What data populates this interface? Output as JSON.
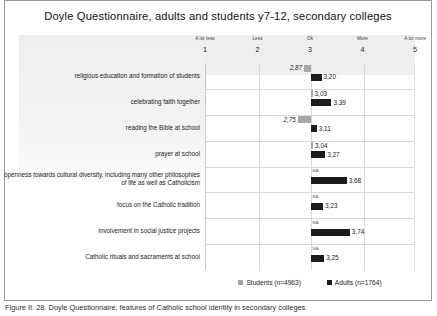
{
  "figure": {
    "caption": "Figure II. 28. Doyle Questionnaire, features of Catholic school identity in secondary colleges"
  },
  "chart_data": {
    "type": "bar",
    "orientation": "horizontal",
    "title": "Doyle Questionnaire, adults and students y7-12, secondary colleges",
    "xlabel": "",
    "ylabel": "",
    "xlim": [
      1,
      5
    ],
    "baseline": 3,
    "grid": true,
    "legend_position": "bottom",
    "axis_ticks": [
      {
        "value": 1,
        "label": "A lot less",
        "number": "1"
      },
      {
        "value": 2,
        "label": "Less",
        "number": "2"
      },
      {
        "value": 3,
        "label": "Ok",
        "number": "3"
      },
      {
        "value": 4,
        "label": "More",
        "number": "4"
      },
      {
        "value": 5,
        "label": "A lot more",
        "number": "5"
      }
    ],
    "categories": [
      "religious education and formation of students",
      "celebrating faith together",
      "reading the Bible at school",
      "prayer at school",
      "openness towards cultural diversity, including many other philosophies of life as well as Catholicism",
      "focus on the Catholic tradition",
      "involvement in social justice projects",
      "Catholic rituals and sacraments at school"
    ],
    "series": [
      {
        "name": "Students (n=4963)",
        "color": "#a6a6a6",
        "values": [
          2.87,
          3.03,
          2.75,
          3.04,
          null,
          null,
          null,
          null
        ],
        "labels": [
          "2,87",
          "3,03",
          "2,75",
          "3,04",
          "N/A",
          "N/A",
          "N/A",
          "N/A"
        ]
      },
      {
        "name": "Adults (n=1764)",
        "color": "#1c1c1c",
        "values": [
          3.2,
          3.39,
          3.11,
          3.27,
          3.68,
          3.23,
          3.74,
          3.25
        ],
        "labels": [
          "3,20",
          "3,39",
          "3,11",
          "3,27",
          "3,68",
          "3,23",
          "3,74",
          "3,25"
        ]
      }
    ],
    "legend": [
      {
        "label": "Students (n=4963)",
        "color": "#a6a6a6"
      },
      {
        "label": "Adults (n=1764)",
        "color": "#1c1c1c"
      }
    ]
  }
}
